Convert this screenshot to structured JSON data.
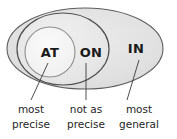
{
  "diagram": {
    "type": "nested-venn",
    "title": "",
    "sets": [
      {
        "id": "in",
        "label": "IN",
        "level": "outer",
        "caption_line1": "most",
        "caption_line2": "general"
      },
      {
        "id": "on",
        "label": "ON",
        "level": "middle",
        "caption_line1": "not as",
        "caption_line2": "precise"
      },
      {
        "id": "at",
        "label": "AT",
        "level": "inner",
        "caption_line1": "most",
        "caption_line2": "precise"
      }
    ],
    "colors": {
      "outer_fill": "#e2e2e2",
      "middle_fill": "#e8e8e8",
      "inner_fill": "#f2f2f2",
      "stroke": "#5e5e5e",
      "inner_stroke": "#8a8a8a",
      "leader_line": "#3a3a3a",
      "text": "#1a1a1a",
      "background": "#ffffff"
    }
  }
}
